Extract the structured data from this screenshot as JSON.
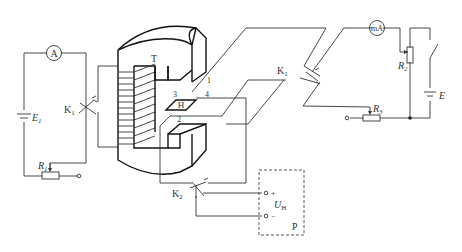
{
  "diagram": {
    "type": "circuit-schematic",
    "components": {
      "ammeter": {
        "symbol": "A"
      },
      "milliammeter": {
        "symbol": "mA"
      },
      "source_e1": {
        "name": "E",
        "sub": "1"
      },
      "source_e": {
        "name": "E"
      },
      "rheostat_r1": {
        "name": "R",
        "sub": "1"
      },
      "rheostat_r2": {
        "name": "R",
        "sub": "2"
      },
      "rheostat_r3": {
        "name": "R",
        "sub": "3"
      },
      "switch_k1_left": {
        "name": "K",
        "sub": "1"
      },
      "switch_k1_right": {
        "name": "K",
        "sub": "1"
      },
      "switch_k2": {
        "name": "K",
        "sub": "2"
      },
      "magnet": {
        "label": "T"
      },
      "hall_element": {
        "label": "H",
        "terminals": [
          "1",
          "2",
          "3",
          "4"
        ]
      },
      "voltmeter_box": {
        "label": "P",
        "voltage": "U",
        "voltage_sub": "H",
        "plus": "+",
        "minus": "−"
      }
    }
  }
}
